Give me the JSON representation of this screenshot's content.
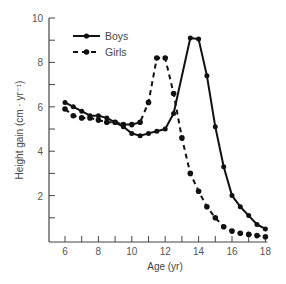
{
  "chart_data": {
    "type": "line",
    "title": "",
    "xlabel": "Age (yr)",
    "ylabel": "Height gain (cm · yr⁻¹)",
    "xlim": [
      5.3,
      18
    ],
    "ylim": [
      0,
      10
    ],
    "xticks": [
      6,
      8,
      10,
      12,
      14,
      16,
      18
    ],
    "xminor_ticks": [
      7,
      9,
      11,
      13,
      15,
      17
    ],
    "yticks": [
      2,
      4,
      6,
      8,
      10
    ],
    "yminor_ticks": [
      1,
      3,
      5,
      7,
      9
    ],
    "grid": false,
    "legend_position": "upper-left",
    "series": [
      {
        "name": "Boys",
        "style": "solid",
        "color": "#111111",
        "x": [
          6.0,
          6.5,
          7.0,
          7.5,
          8.0,
          8.5,
          9.0,
          9.5,
          10.0,
          10.5,
          11.0,
          11.5,
          12.0,
          12.5,
          13.5,
          14.0,
          14.5,
          15.0,
          15.5,
          16.0,
          16.5,
          17.0,
          17.5,
          18.0
        ],
        "values": [
          6.2,
          6.0,
          5.8,
          5.6,
          5.6,
          5.5,
          5.3,
          5.1,
          4.8,
          4.7,
          4.8,
          4.9,
          5.0,
          5.7,
          9.1,
          9.05,
          7.4,
          5.1,
          3.3,
          2.0,
          1.5,
          1.1,
          0.7,
          0.5
        ]
      },
      {
        "name": "Girls",
        "style": "dashed",
        "color": "#111111",
        "x": [
          6.0,
          6.5,
          7.0,
          7.5,
          8.0,
          8.5,
          9.0,
          9.5,
          10.0,
          10.5,
          11.0,
          11.5,
          12.0,
          12.5,
          13.0,
          13.5,
          14.0,
          14.5,
          15.0,
          15.5,
          16.0,
          16.5,
          17.0,
          17.5,
          18.0
        ],
        "values": [
          5.9,
          5.6,
          5.5,
          5.5,
          5.4,
          5.3,
          5.3,
          5.2,
          5.2,
          5.3,
          6.2,
          8.2,
          8.2,
          6.6,
          4.6,
          3.0,
          2.2,
          1.5,
          1.0,
          0.6,
          0.4,
          0.3,
          0.25,
          0.2,
          0.15
        ]
      }
    ]
  },
  "legend": {
    "boys_label": "Boys",
    "girls_label": "Girls"
  },
  "axes": {
    "x_title": "Age (yr)",
    "y_title": "Height gain (cm · yr⁻¹)",
    "x_tick_labels": [
      "6",
      "8",
      "10",
      "12",
      "14",
      "16",
      "18"
    ],
    "y_tick_labels": [
      "2",
      "4",
      "6",
      "8",
      "10"
    ]
  }
}
